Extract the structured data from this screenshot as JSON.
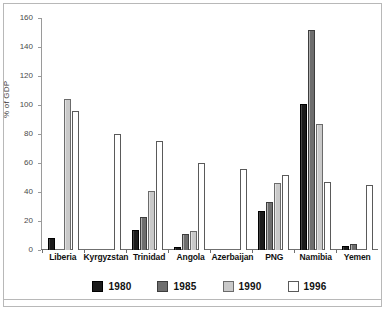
{
  "chart_data": {
    "type": "bar",
    "title": "",
    "xlabel": "",
    "ylabel": "% of GDP",
    "ylim": [
      0,
      160
    ],
    "yticks": [
      0,
      20,
      40,
      60,
      80,
      100,
      120,
      140,
      160
    ],
    "grid": false,
    "legend_position": "bottom",
    "categories": [
      "Liberia",
      "Kyrgyzstan",
      "Trinidad",
      "Angola",
      "Azerbaijan",
      "PNG",
      "Namibia",
      "Yemen"
    ],
    "series": [
      {
        "name": "1980",
        "color": "#1b1b1b",
        "values": [
          8,
          0,
          14,
          2,
          0,
          27,
          101,
          3
        ]
      },
      {
        "name": "1985",
        "color": "#6e6e6e",
        "values": [
          0,
          0,
          23,
          11,
          0,
          33,
          152,
          4
        ]
      },
      {
        "name": "1990",
        "color": "#c9c9c9",
        "values": [
          104,
          0,
          41,
          13,
          0,
          46,
          87,
          1
        ]
      },
      {
        "name": "1996",
        "color": "#ffffff",
        "values": [
          96,
          80,
          75,
          60,
          56,
          52,
          47,
          45
        ]
      }
    ]
  },
  "axis": {
    "y_label": "% of GDP",
    "y_ticks": [
      "0",
      "20",
      "40",
      "60",
      "80",
      "100",
      "120",
      "140",
      "160"
    ]
  },
  "legend": {
    "items": [
      {
        "label": "1980",
        "swatch": "c1980"
      },
      {
        "label": "1985",
        "swatch": "c1985"
      },
      {
        "label": "1990",
        "swatch": "c1990"
      },
      {
        "label": "1996",
        "swatch": "c1996"
      }
    ]
  }
}
